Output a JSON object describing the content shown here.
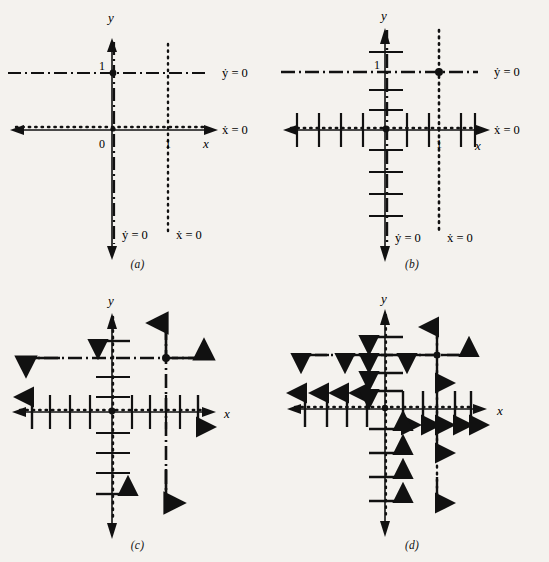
{
  "figure": {
    "panels": [
      {
        "id": "a",
        "caption": "(a)",
        "description": "Nullclines only: x-nullcline dotted, y-nullcline dash-dot",
        "axes": {
          "x_label": "x",
          "y_label": "y"
        },
        "tick_labels": {
          "origin": "0",
          "x_one": "1",
          "y_one": "1"
        },
        "annotations": [
          {
            "name": "ydot-zero-right",
            "text": "ẏ = 0"
          },
          {
            "name": "xdot-zero-right",
            "text": "ẋ = 0"
          },
          {
            "name": "ydot-zero-bottom",
            "text": "ẏ = 0"
          },
          {
            "name": "xdot-zero-bottom",
            "text": "ẋ = 0"
          }
        ]
      },
      {
        "id": "b",
        "caption": "(b)",
        "description": "Nullclines with perpendicular hash marks added",
        "axes": {
          "x_label": "x",
          "y_label": "y"
        },
        "tick_labels": {
          "x_one": "1",
          "y_one": "1"
        },
        "annotations": [
          {
            "name": "ydot-zero-right",
            "text": "ẏ = 0"
          },
          {
            "name": "xdot-zero-right",
            "text": "ẋ = 0"
          },
          {
            "name": "ydot-zero-bottom",
            "text": "ẏ = 0"
          },
          {
            "name": "xdot-zero-bottom",
            "text": "ẋ = 0"
          }
        ]
      },
      {
        "id": "c",
        "caption": "(c)",
        "description": "Hash marks with a few direction arrowheads resolved",
        "axes": {
          "x_label": "x",
          "y_label": "y"
        },
        "tick_labels": {},
        "annotations": []
      },
      {
        "id": "d",
        "caption": "(d)",
        "description": "All hash marks resolved into direction arrows",
        "axes": {
          "x_label": "x",
          "y_label": "y"
        },
        "tick_labels": {},
        "annotations": []
      }
    ],
    "nullclines": {
      "xdot_zero": {
        "label": "ẋ = 0",
        "style": "dotted",
        "lines": [
          "y = 0 (x-axis)",
          "x = 1 (vertical)"
        ]
      },
      "ydot_zero": {
        "label": "ẏ = 0",
        "style": "dash-dot",
        "lines": [
          "x = 0 (y-axis)",
          "y = 1 (horizontal)"
        ]
      }
    },
    "fixed_points": [
      {
        "name": "origin",
        "x": 0,
        "y": 0
      },
      {
        "name": "interior",
        "x": 1,
        "y": 1
      }
    ],
    "colors": {
      "ink": "#111111",
      "page": "#f4f2ee"
    }
  }
}
